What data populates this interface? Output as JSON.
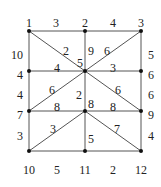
{
  "diagram": {
    "type": "weighted-graph",
    "nodes": [
      {
        "id": "1",
        "x": 29,
        "y": 31,
        "lx": 29,
        "ly": 23
      },
      {
        "id": "2",
        "x": 85,
        "y": 31,
        "lx": 85,
        "ly": 23
      },
      {
        "id": "3",
        "x": 141,
        "y": 31,
        "lx": 141,
        "ly": 23
      },
      {
        "id": "4",
        "x": 29,
        "y": 71,
        "lx": 20,
        "ly": 75
      },
      {
        "id": "5",
        "x": 85,
        "y": 71,
        "lx": 80,
        "ly": 63
      },
      {
        "id": "6",
        "x": 141,
        "y": 71,
        "lx": 151,
        "ly": 75
      },
      {
        "id": "7",
        "x": 29,
        "y": 111,
        "lx": 20,
        "ly": 115
      },
      {
        "id": "8",
        "x": 85,
        "y": 111,
        "lx": 91,
        "ly": 104
      },
      {
        "id": "9",
        "x": 141,
        "y": 111,
        "lx": 151,
        "ly": 115
      },
      {
        "id": "10",
        "x": 29,
        "y": 151,
        "lx": 29,
        "ly": 170
      },
      {
        "id": "11",
        "x": 85,
        "y": 151,
        "lx": 85,
        "ly": 170
      },
      {
        "id": "12",
        "x": 141,
        "y": 151,
        "lx": 141,
        "ly": 170
      }
    ],
    "edges": [
      {
        "from": "1",
        "to": "2",
        "weight": "3",
        "lx": 56,
        "ly": 23
      },
      {
        "from": "2",
        "to": "3",
        "weight": "4",
        "lx": 113,
        "ly": 23
      },
      {
        "from": "1",
        "to": "4",
        "weight": "10",
        "lx": 17,
        "ly": 55
      },
      {
        "from": "3",
        "to": "6",
        "weight": "5",
        "lx": 151,
        "ly": 55
      },
      {
        "from": "1",
        "to": "5",
        "weight": "2",
        "lx": 66,
        "ly": 51
      },
      {
        "from": "2",
        "to": "5",
        "weight": "9",
        "lx": 91,
        "ly": 51
      },
      {
        "from": "3",
        "to": "5",
        "weight": "6",
        "lx": 107,
        "ly": 51
      },
      {
        "from": "4",
        "to": "5",
        "weight": "4",
        "lx": 57,
        "ly": 68
      },
      {
        "from": "5",
        "to": "6",
        "weight": "3",
        "lx": 113,
        "ly": 68
      },
      {
        "from": "4",
        "to": "7",
        "weight": "4",
        "lx": 20,
        "ly": 95
      },
      {
        "from": "6",
        "to": "9",
        "weight": "6",
        "lx": 151,
        "ly": 95
      },
      {
        "from": "5",
        "to": "7",
        "weight": "6",
        "lx": 52,
        "ly": 90
      },
      {
        "from": "5",
        "to": "8",
        "weight": "2",
        "lx": 79,
        "ly": 95
      },
      {
        "from": "5",
        "to": "9",
        "weight": "6",
        "lx": 118,
        "ly": 90
      },
      {
        "from": "7",
        "to": "8",
        "weight": "8",
        "lx": 57,
        "ly": 107
      },
      {
        "from": "8",
        "to": "9",
        "weight": "8",
        "lx": 113,
        "ly": 107
      },
      {
        "from": "7",
        "to": "10",
        "weight": "3",
        "lx": 20,
        "ly": 136
      },
      {
        "from": "9",
        "to": "12",
        "weight": "4",
        "lx": 151,
        "ly": 136
      },
      {
        "from": "8",
        "to": "10",
        "weight": "3",
        "lx": 53,
        "ly": 129
      },
      {
        "from": "8",
        "to": "11",
        "weight": "5",
        "lx": 91,
        "ly": 139
      },
      {
        "from": "8",
        "to": "12",
        "weight": "7",
        "lx": 117,
        "ly": 129
      },
      {
        "from": "10",
        "to": "11",
        "weight": "5",
        "lx": 57,
        "ly": 170
      },
      {
        "from": "11",
        "to": "12",
        "weight": "2",
        "lx": 113,
        "ly": 170
      }
    ]
  }
}
